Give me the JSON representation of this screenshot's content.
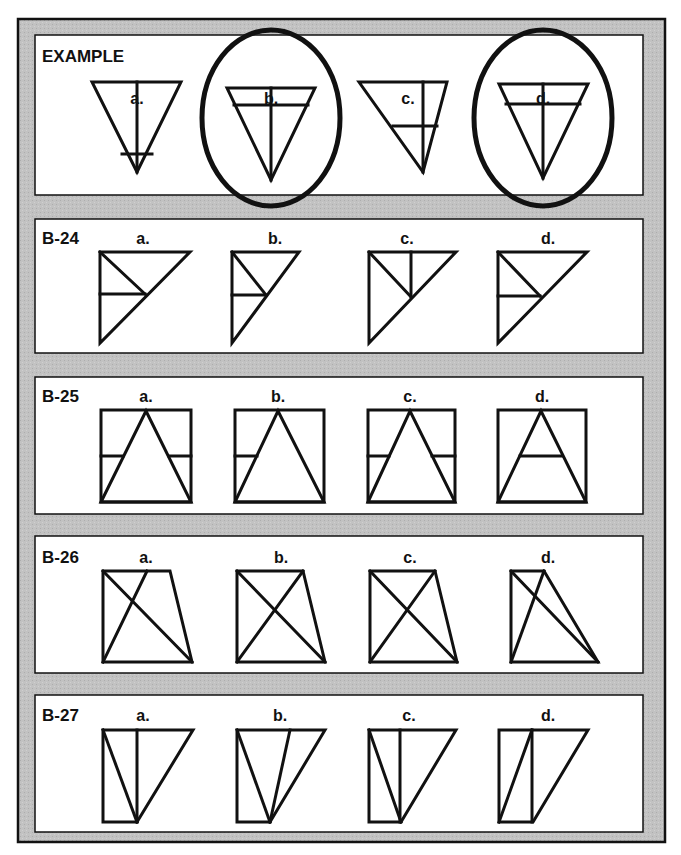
{
  "worksheet": {
    "colors": {
      "frame": "#bdbdbd",
      "panel": "#ffffff",
      "ink": "#111111"
    },
    "answer_labels": [
      "a.",
      "b.",
      "c.",
      "d."
    ],
    "problems": [
      {
        "id": "EXAMPLE",
        "title": "EXAMPLE",
        "circled_answers": [
          "b.",
          "d."
        ],
        "figures": [
          {
            "label": "a.",
            "shape": "inverted-triangle",
            "detail": "vertical center line, horizontal bar near bottom",
            "circled": false
          },
          {
            "label": "b.",
            "shape": "inverted-triangle",
            "detail": "vertical center line, horizontal bar near top",
            "circled": true
          },
          {
            "label": "c.",
            "shape": "slanted inverted-triangle",
            "detail": "vertical line on right, horizontal bar at middle",
            "circled": false
          },
          {
            "label": "d.",
            "shape": "inverted-triangle",
            "detail": "vertical center line, horizontal bar near top",
            "circled": true
          }
        ]
      },
      {
        "id": "B-24",
        "title": "B-24",
        "circled_answers": [],
        "figures": [
          {
            "label": "a.",
            "shape": "right-triangle",
            "detail": "diagonal from top-left corner to hypotenuse, horizontal to left side",
            "circled": false
          },
          {
            "label": "b.",
            "shape": "right-triangle (narrow)",
            "detail": "diagonal from top-left corner to hypotenuse, horizontal to left side",
            "circled": false
          },
          {
            "label": "c.",
            "shape": "right-triangle",
            "detail": "diagonal from top-left corner to hypotenuse, vertical to top side",
            "circled": false
          },
          {
            "label": "d.",
            "shape": "right-triangle",
            "detail": "diagonal from top-left corner to hypotenuse, horizontal to left side",
            "circled": false
          }
        ]
      },
      {
        "id": "B-25",
        "title": "B-25",
        "circled_answers": [],
        "figures": [
          {
            "label": "a.",
            "shape": "square with triangle",
            "detail": "horizontal bars on both outer sides",
            "circled": false
          },
          {
            "label": "b.",
            "shape": "square with triangle",
            "detail": "horizontal bar on left outer side only",
            "circled": false
          },
          {
            "label": "c.",
            "shape": "square with triangle",
            "detail": "horizontal bars on both outer sides",
            "circled": false
          },
          {
            "label": "d.",
            "shape": "square with triangle",
            "detail": "horizontal bar inside triangle",
            "circled": false
          }
        ]
      },
      {
        "id": "B-26",
        "title": "B-26",
        "circled_answers": [],
        "figures": [
          {
            "label": "a.",
            "shape": "trapezoid",
            "detail": "crossing lines, one from mid-top",
            "circled": false
          },
          {
            "label": "b.",
            "shape": "trapezoid",
            "detail": "full diagonals",
            "circled": false
          },
          {
            "label": "c.",
            "shape": "trapezoid",
            "detail": "full diagonals",
            "circled": false
          },
          {
            "label": "d.",
            "shape": "narrow-top trapezoid",
            "detail": "full diagonals",
            "circled": false
          }
        ]
      },
      {
        "id": "B-27",
        "title": "B-27",
        "circled_answers": [],
        "figures": [
          {
            "label": "a.",
            "shape": "rectangle + triangle",
            "detail": "vertical divider, diagonal in left cell to bottom point",
            "circled": false
          },
          {
            "label": "b.",
            "shape": "rectangle + triangle",
            "detail": "two lines converging at bottom point",
            "circled": false
          },
          {
            "label": "c.",
            "shape": "rectangle + triangle",
            "detail": "vertical divider, diagonal in left cell to bottom point",
            "circled": false
          },
          {
            "label": "d.",
            "shape": "rectangle + triangle",
            "detail": "vertical divider, diagonal from top of divider to bottom-left",
            "circled": false
          }
        ]
      }
    ]
  }
}
